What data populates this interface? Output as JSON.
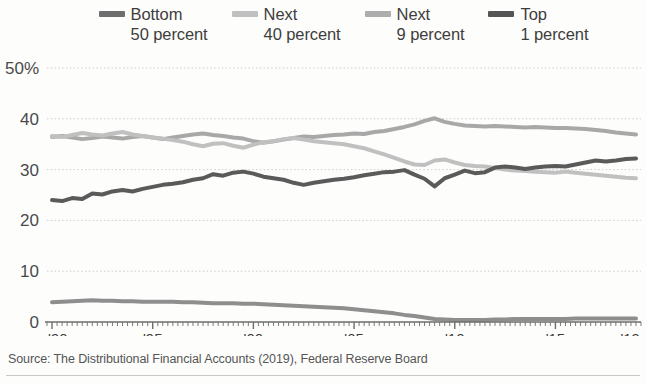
{
  "legend": {
    "position": "top",
    "entries": [
      {
        "name": "bottom-50",
        "line1": "Bottom",
        "line2": "50 percent",
        "color": "#6e6e6e"
      },
      {
        "name": "next-40",
        "line1": "Next",
        "line2": "40 percent",
        "color": "#b9b9b9"
      },
      {
        "name": "next-9",
        "line1": "Next",
        "line2": "9 percent",
        "color": "#a8a8a8"
      },
      {
        "name": "top-1",
        "line1": "Top",
        "line2": "1 percent",
        "color": "#555555"
      }
    ]
  },
  "source": {
    "text": "Source: The Distributional Financial Accounts (2019), Federal Reserve Board"
  },
  "chart_data": {
    "type": "line",
    "title": "",
    "subtitle": "",
    "xlabel": "",
    "ylabel": "",
    "ylim": [
      0,
      50
    ],
    "xlim": [
      1989.75,
      2019.25
    ],
    "grid": true,
    "legend_position": "top",
    "yticks": [
      0,
      10,
      20,
      30,
      40,
      50
    ],
    "ytick_labels": [
      "0",
      "10",
      "20",
      "30",
      "40",
      "50%"
    ],
    "xticks": [
      1990,
      1995,
      2000,
      2005,
      2010,
      2015,
      2019
    ],
    "xtick_labels": [
      "'90",
      "'95",
      "'00",
      "'05",
      "'10",
      "'15",
      "'19"
    ],
    "x": [
      1990,
      1990.5,
      1991,
      1991.5,
      1992,
      1992.5,
      1993,
      1993.5,
      1994,
      1994.5,
      1995,
      1995.5,
      1996,
      1996.5,
      1997,
      1997.5,
      1998,
      1998.5,
      1999,
      1999.5,
      2000,
      2000.5,
      2001,
      2001.5,
      2002,
      2002.5,
      2003,
      2003.5,
      2004,
      2004.5,
      2005,
      2005.5,
      2006,
      2006.5,
      2007,
      2007.5,
      2008,
      2008.5,
      2009,
      2009.5,
      2010,
      2010.5,
      2011,
      2011.5,
      2012,
      2012.5,
      2013,
      2013.5,
      2014,
      2014.5,
      2015,
      2015.5,
      2016,
      2016.5,
      2017,
      2017.5,
      2018,
      2018.5,
      2019
    ],
    "series": [
      {
        "name": "Next 9 percent",
        "color": "#a8a8a8",
        "values": [
          36.4,
          36.6,
          36.3,
          36.0,
          36.2,
          36.5,
          36.3,
          36.1,
          36.4,
          36.6,
          36.3,
          36.0,
          36.3,
          36.6,
          36.9,
          37.1,
          36.8,
          36.6,
          36.3,
          36.1,
          35.6,
          35.3,
          35.6,
          35.9,
          36.2,
          36.5,
          36.4,
          36.6,
          36.8,
          36.9,
          37.1,
          37.0,
          37.4,
          37.6,
          38.0,
          38.4,
          38.9,
          39.6,
          40.1,
          39.4,
          39.0,
          38.7,
          38.6,
          38.5,
          38.6,
          38.5,
          38.4,
          38.3,
          38.4,
          38.3,
          38.2,
          38.2,
          38.1,
          38.0,
          37.8,
          37.6,
          37.3,
          37.1,
          36.9
        ]
      },
      {
        "name": "Next 40 percent",
        "color": "#c0c0c0",
        "values": [
          36.6,
          36.4,
          36.8,
          37.2,
          36.9,
          36.7,
          37.1,
          37.4,
          36.9,
          36.6,
          36.3,
          36.1,
          35.8,
          35.5,
          35.0,
          34.6,
          35.1,
          35.2,
          34.7,
          34.3,
          34.9,
          35.4,
          35.6,
          36.0,
          36.2,
          35.9,
          35.6,
          35.4,
          35.2,
          35.0,
          34.6,
          34.2,
          33.6,
          33.0,
          32.3,
          31.6,
          31.0,
          30.9,
          31.8,
          32.0,
          31.4,
          30.9,
          30.7,
          30.6,
          30.3,
          30.0,
          29.8,
          29.7,
          29.6,
          29.5,
          29.4,
          29.6,
          29.4,
          29.2,
          29.0,
          28.8,
          28.6,
          28.4,
          28.3
        ]
      },
      {
        "name": "Top 1 percent",
        "color": "#5a5a5a",
        "values": [
          24.0,
          23.8,
          24.4,
          24.2,
          25.3,
          25.1,
          25.7,
          26.0,
          25.7,
          26.2,
          26.6,
          27.0,
          27.2,
          27.5,
          28.0,
          28.3,
          29.1,
          28.8,
          29.4,
          29.6,
          29.2,
          28.6,
          28.3,
          28.0,
          27.4,
          27.0,
          27.4,
          27.7,
          28.0,
          28.2,
          28.5,
          28.9,
          29.2,
          29.5,
          29.6,
          29.9,
          29.0,
          28.2,
          26.7,
          28.3,
          29.0,
          29.8,
          29.3,
          29.5,
          30.4,
          30.6,
          30.4,
          30.1,
          30.4,
          30.6,
          30.7,
          30.6,
          31.0,
          31.4,
          31.8,
          31.6,
          31.8,
          32.1,
          32.2
        ]
      },
      {
        "name": "Bottom 50 percent",
        "color": "#8e8e8e",
        "values": [
          3.9,
          4.0,
          4.1,
          4.2,
          4.3,
          4.2,
          4.2,
          4.1,
          4.1,
          4.0,
          4.0,
          4.0,
          4.0,
          3.9,
          3.9,
          3.8,
          3.7,
          3.7,
          3.7,
          3.6,
          3.6,
          3.5,
          3.4,
          3.3,
          3.2,
          3.1,
          3.0,
          2.9,
          2.8,
          2.7,
          2.5,
          2.3,
          2.1,
          1.9,
          1.7,
          1.4,
          1.2,
          0.9,
          0.6,
          0.5,
          0.4,
          0.4,
          0.4,
          0.4,
          0.5,
          0.5,
          0.6,
          0.6,
          0.6,
          0.6,
          0.6,
          0.6,
          0.7,
          0.7,
          0.7,
          0.7,
          0.7,
          0.7,
          0.7
        ]
      }
    ]
  }
}
